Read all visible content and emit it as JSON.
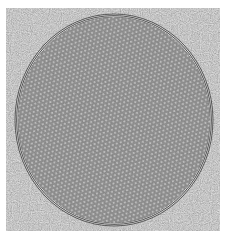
{
  "image": {
    "kind": "micrograph",
    "description": "Grayscale micrograph of a circular region filled with a hexagonal lattice of dots, bounded by concentric rings, on a noisy gray background",
    "colors": {
      "margin": "#ffffff",
      "background": "#8c8c8c",
      "disk_fill": "#7a7a7a",
      "lattice_dot": "#bcbcbc",
      "ring_dark": "#3a3a3a",
      "ring_light": "#e0e0e0"
    },
    "disk": {
      "cx": 108,
      "cy": 112,
      "rx": 99,
      "ry": 106
    },
    "lattice_spacing": 4.2,
    "ring_count": 4
  }
}
